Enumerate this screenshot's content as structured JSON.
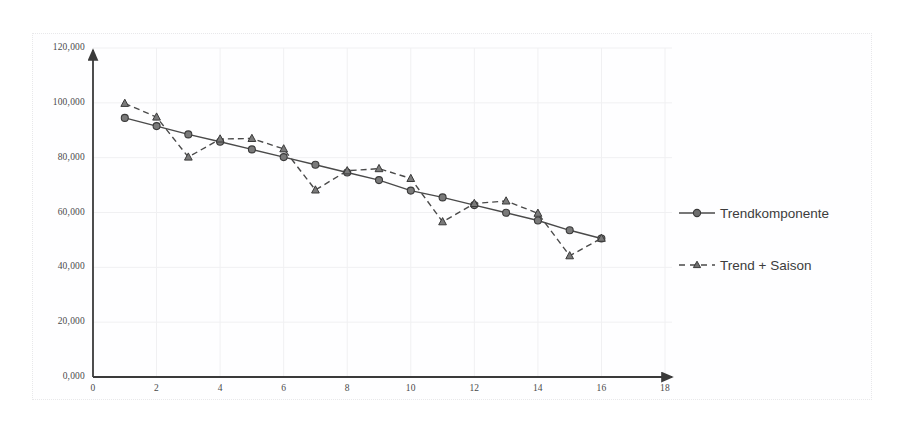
{
  "chart_data": {
    "type": "line",
    "title": "",
    "xlabel": "",
    "ylabel": "",
    "xlim": [
      0,
      18
    ],
    "ylim": [
      0,
      120000
    ],
    "grid": true,
    "legend_position": "right",
    "x_tick_labels": [
      "0",
      "2",
      "4",
      "6",
      "8",
      "10",
      "12",
      "14",
      "16",
      "18"
    ],
    "x_ticks": [
      0,
      2,
      4,
      6,
      8,
      10,
      12,
      14,
      16,
      18
    ],
    "y_tick_labels": [
      "0,000",
      "20,000",
      "40,000",
      "60,000",
      "80,000",
      "100,000",
      "120,000"
    ],
    "y_ticks": [
      0,
      20000,
      40000,
      60000,
      80000,
      100000,
      120000
    ],
    "x": [
      1,
      2,
      3,
      4,
      5,
      6,
      7,
      8,
      9,
      10,
      11,
      12,
      13,
      14,
      15,
      16
    ],
    "series": [
      {
        "name": "Trendkomponente",
        "marker": "circle",
        "line_style": "solid",
        "color": "#4a4a4a",
        "values": [
          94500,
          91500,
          88500,
          85800,
          83000,
          80200,
          77400,
          74600,
          71800,
          68000,
          65500,
          62700,
          59900,
          57100,
          53500,
          50500
        ]
      },
      {
        "name": "Trend + Saison",
        "marker": "triangle",
        "line_style": "dashed",
        "color": "#4a4a4a",
        "values": [
          99800,
          94800,
          80200,
          86800,
          87000,
          83200,
          68200,
          75200,
          76000,
          72400,
          56600,
          63300,
          64200,
          59700,
          44200,
          50600
        ]
      }
    ]
  },
  "legend": {
    "items": [
      {
        "label": "Trendkomponente",
        "marker": "circle",
        "style": "solid"
      },
      {
        "label": "Trend + Saison",
        "marker": "triangle",
        "style": "dashed"
      }
    ]
  },
  "colors": {
    "axis": "#3a3a3a",
    "grid": "#f0f0f2",
    "series": "#4a4a4a",
    "text": "#4a4a4a",
    "frame": "#e8e8ea",
    "background": "#ffffff"
  }
}
